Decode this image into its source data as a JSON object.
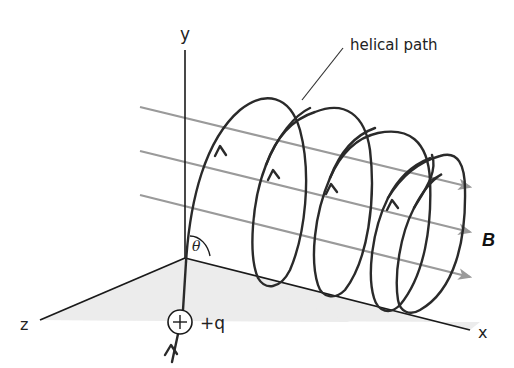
{
  "diagram": {
    "labels": {
      "y_axis": "y",
      "x_axis": "x",
      "z_axis": "z",
      "helical_path": "helical path",
      "field": "B",
      "charge": "+q",
      "angle": "θ"
    },
    "colors": {
      "axis": "#1a1a1a",
      "path": "#2a2a2a",
      "field_lines": "#9a9a9a",
      "floor": "#ececec"
    },
    "field_lines_count": 3,
    "helix_loops": 4
  }
}
